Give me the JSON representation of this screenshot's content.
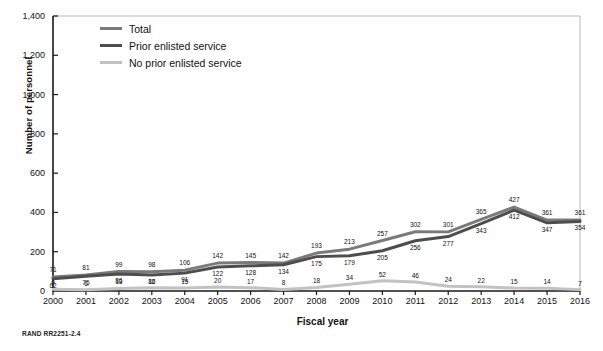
{
  "credit": "RAND RR2251-2.4",
  "legend": {
    "position": "top-left",
    "items": [
      {
        "label": "Total",
        "color": "#7a7a7a"
      },
      {
        "label": "Prior enlisted service",
        "color": "#4d4d4d"
      },
      {
        "label": "No prior enlisted service",
        "color": "#c2c2c2"
      }
    ]
  },
  "chart_data": {
    "type": "line",
    "title": "",
    "xlabel": "Fiscal year",
    "ylabel": "Number of personnel",
    "ylim": [
      0,
      1400
    ],
    "ytick_step": 200,
    "grid": false,
    "ytick_labels": [
      "0",
      "200",
      "400",
      "600",
      "800",
      "1,000",
      "1,200",
      "1,400"
    ],
    "ytick_values": [
      0,
      200,
      400,
      600,
      800,
      1000,
      1200,
      1400
    ],
    "categories": [
      2000,
      2001,
      2002,
      2003,
      2004,
      2005,
      2006,
      2007,
      2008,
      2009,
      2010,
      2011,
      2012,
      2013,
      2014,
      2015,
      2016
    ],
    "xtick_labels": [
      "2000",
      "2001",
      "2002",
      "2003",
      "2004",
      "2005",
      "2006",
      "2007",
      "2008",
      "2009",
      "2010",
      "2011",
      "2012",
      "2013",
      "2014",
      "2015",
      "2016"
    ],
    "series": [
      {
        "name": "Total",
        "color": "#7a7a7a",
        "values": [
          71,
          81,
          99,
          98,
          106,
          142,
          145,
          142,
          193,
          213,
          257,
          302,
          301,
          365,
          427,
          361,
          361
        ]
      },
      {
        "name": "Prior enlisted service",
        "color": "#4d4d4d",
        "values": [
          62,
          75,
          86,
          82,
          91,
          122,
          128,
          134,
          175,
          179,
          205,
          256,
          277,
          343,
          412,
          347,
          354
        ]
      },
      {
        "name": "No prior enlisted service",
        "color": "#c2c2c2",
        "values": [
          9,
          6,
          13,
          16,
          15,
          20,
          17,
          8,
          18,
          34,
          52,
          46,
          24,
          22,
          15,
          14,
          7
        ]
      }
    ]
  }
}
